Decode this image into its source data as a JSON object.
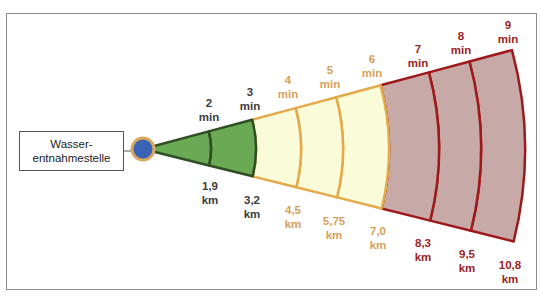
{
  "source": {
    "line1": "Wasser-",
    "line2": "entnahmestelle"
  },
  "colors": {
    "green_fill": "#6aaa55",
    "green_stroke": "#2e4d22",
    "green_text": "#3c3c3c",
    "yellow_fill": "#fafbd9",
    "yellow_stroke": "#e3a94a",
    "yellow_text": "#d6a05a",
    "red_fill": "#c7a9a8",
    "red_stroke": "#9e1a1a",
    "red_text": "#9b2226",
    "dot_fill": "#3b63b5",
    "dot_ring": "#d8a85e"
  },
  "zones": [
    {
      "id": "green",
      "from_min": 0,
      "to_min": 3
    },
    {
      "id": "yellow",
      "from_min": 3,
      "to_min": 6
    },
    {
      "id": "red",
      "from_min": 6,
      "to_min": 9
    }
  ],
  "time_labels": [
    {
      "value": "2",
      "unit": "min",
      "zone": "green"
    },
    {
      "value": "3",
      "unit": "min",
      "zone": "green"
    },
    {
      "value": "4",
      "unit": "min",
      "zone": "yellow"
    },
    {
      "value": "5",
      "unit": "min",
      "zone": "yellow"
    },
    {
      "value": "6",
      "unit": "min",
      "zone": "yellow"
    },
    {
      "value": "7",
      "unit": "min",
      "zone": "red"
    },
    {
      "value": "8",
      "unit": "min",
      "zone": "red"
    },
    {
      "value": "9",
      "unit": "min",
      "zone": "red"
    }
  ],
  "distance_labels": [
    {
      "value": "1,9",
      "unit": "km",
      "zone": "green"
    },
    {
      "value": "3,2",
      "unit": "km",
      "zone": "green"
    },
    {
      "value": "4,5",
      "unit": "km",
      "zone": "yellow"
    },
    {
      "value": "5,75",
      "unit": "km",
      "zone": "yellow"
    },
    {
      "value": "7,0",
      "unit": "km",
      "zone": "yellow"
    },
    {
      "value": "8,3",
      "unit": "km",
      "zone": "red"
    },
    {
      "value": "9,5",
      "unit": "km",
      "zone": "red"
    },
    {
      "value": "10,8",
      "unit": "km",
      "zone": "red"
    }
  ]
}
